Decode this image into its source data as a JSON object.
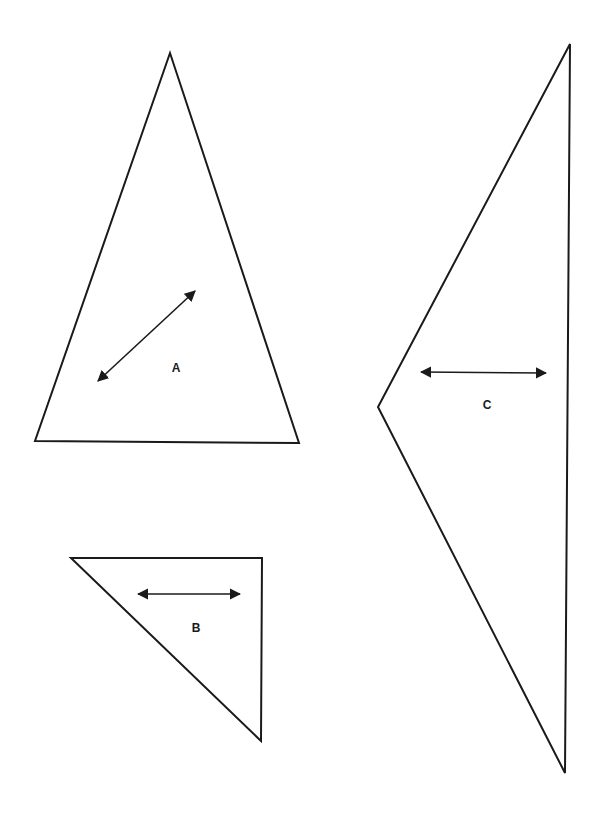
{
  "diagram": {
    "shapes": [
      {
        "id": "A",
        "label": "A",
        "points": "170,53 35,441 299,443",
        "arrow": {
          "x1": 98,
          "y1": 381,
          "x2": 195,
          "y2": 291
        },
        "label_pos": {
          "x": 176,
          "y": 372
        }
      },
      {
        "id": "B",
        "label": "B",
        "points": "71,558 262,558 261,741",
        "arrow": {
          "x1": 138,
          "y1": 594,
          "x2": 240,
          "y2": 594
        },
        "label_pos": {
          "x": 196,
          "y": 632
        }
      },
      {
        "id": "C",
        "label": "C",
        "points": "570,44 378,407 565,773",
        "arrow": {
          "x1": 421,
          "y1": 372,
          "x2": 546,
          "y2": 373
        },
        "label_pos": {
          "x": 487,
          "y": 409
        }
      }
    ],
    "stroke_color": "#1a1a1a"
  }
}
